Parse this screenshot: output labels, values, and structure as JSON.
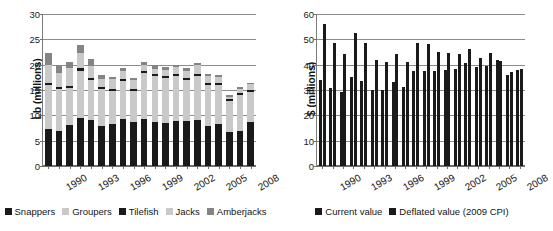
{
  "chart_data": [
    {
      "id": "landings",
      "type": "bar",
      "barmode": "stacked",
      "title": "",
      "xlabel": "",
      "ylabel": "Lb (millions)",
      "ylim": [
        0,
        30
      ],
      "yticks": [
        0,
        5,
        10,
        15,
        20,
        25,
        30
      ],
      "grid": true,
      "legend_position": "bottom",
      "categories": [
        1990,
        1991,
        1992,
        1993,
        1994,
        1995,
        1996,
        1997,
        1998,
        1999,
        2000,
        2001,
        2002,
        2003,
        2004,
        2005,
        2006,
        2007,
        2008,
        2009
      ],
      "tick_labels": [
        "1990",
        "",
        "",
        "1993",
        "",
        "",
        "1996",
        "",
        "",
        "1999",
        "",
        "",
        "2002",
        "",
        "",
        "2005",
        "",
        "",
        "2008",
        ""
      ],
      "series": [
        {
          "name": "Snappers",
          "color": "#1a1a1a",
          "values": [
            7.3,
            7.0,
            8.1,
            9.5,
            9.0,
            7.8,
            8.2,
            9.2,
            8.6,
            9.2,
            8.6,
            8.4,
            8.8,
            8.8,
            9.0,
            7.8,
            8.2,
            6.8,
            7.0,
            8.6
          ]
        },
        {
          "name": "Groupers",
          "color": "#c9c9c9",
          "values": [
            8.6,
            8.1,
            7.2,
            9.3,
            8.0,
            7.4,
            6.6,
            7.6,
            6.2,
            9.1,
            9.1,
            8.9,
            8.9,
            8.2,
            8.8,
            8.2,
            7.7,
            6.0,
            7.1,
            6.0
          ]
        },
        {
          "name": "Tilefish",
          "color": "#1a1a1a",
          "values": [
            0.5,
            0.5,
            0.5,
            0.5,
            0.4,
            0.4,
            0.4,
            0.4,
            0.4,
            0.4,
            0.4,
            0.4,
            0.4,
            0.4,
            0.4,
            0.4,
            0.4,
            0.4,
            0.4,
            0.4
          ]
        },
        {
          "name": "Jacks",
          "color": "#c9c9c9",
          "values": [
            3.6,
            2.8,
            3.5,
            3.0,
            2.3,
            1.6,
            1.9,
            1.5,
            1.8,
            1.2,
            1.1,
            1.2,
            1.4,
            1.3,
            1.8,
            1.3,
            1.3,
            0.4,
            0.7,
            1.1
          ]
        },
        {
          "name": "Amberjacks",
          "color": "#848484",
          "values": [
            2.3,
            1.5,
            1.3,
            1.5,
            1.5,
            0.8,
            0.5,
            0.6,
            0.3,
            0.6,
            0.8,
            0.6,
            0.5,
            0.7,
            0.4,
            0.5,
            0.4,
            0.5,
            0.4,
            0.3
          ]
        }
      ],
      "legend": [
        "Snappers",
        "Groupers",
        "Tilefish",
        "Jacks",
        "Amberjacks"
      ]
    },
    {
      "id": "value",
      "type": "bar",
      "barmode": "grouped",
      "title": "",
      "xlabel": "",
      "ylabel": "$ (millions)",
      "ylim": [
        0,
        60
      ],
      "yticks": [
        0,
        10,
        20,
        30,
        40,
        50,
        60
      ],
      "grid": true,
      "legend_position": "bottom",
      "categories": [
        1990,
        1991,
        1992,
        1993,
        1994,
        1995,
        1996,
        1997,
        1998,
        1999,
        2000,
        2001,
        2002,
        2003,
        2004,
        2005,
        2006,
        2007,
        2008,
        2009
      ],
      "tick_labels": [
        "1990",
        "",
        "",
        "1993",
        "",
        "",
        "1996",
        "",
        "",
        "1999",
        "",
        "",
        "2002",
        "",
        "",
        "2005",
        "",
        "",
        "2008",
        ""
      ],
      "series": [
        {
          "name": "Current value",
          "color": "#1a1a1a",
          "values": [
            34.0,
            30.7,
            29.1,
            35.2,
            33.6,
            30.0,
            30.1,
            33.1,
            31.0,
            37.6,
            37.4,
            37.4,
            37.8,
            38.2,
            40.6,
            39.2,
            39.3,
            41.8,
            36.1,
            38.0
          ]
        },
        {
          "name": "Deflated value (2009 CPI)",
          "color": "#1a1a1a",
          "values": [
            56.0,
            48.6,
            44.4,
            52.4,
            48.6,
            42.0,
            41.1,
            44.2,
            41.1,
            48.6,
            48.0,
            45.1,
            44.5,
            44.4,
            46.1,
            42.8,
            44.6,
            41.6,
            37.0,
            38.1
          ]
        }
      ],
      "legend": [
        "Current value",
        "Deflated value (2009 CPI)"
      ]
    }
  ]
}
